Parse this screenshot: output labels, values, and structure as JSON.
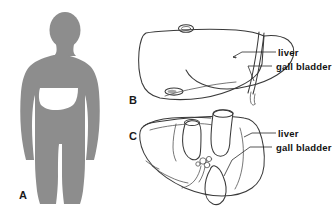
{
  "figure": {
    "background_color": "#ffffff",
    "ink_color": "#3a3a3a",
    "silhouette_color": "#8d8d8d",
    "organ_shade_color": "#9a9a9a"
  },
  "panels": [
    {
      "id": "A",
      "letter": "A",
      "caption": "",
      "description": "body-silhouette-with-liver-position"
    },
    {
      "id": "B",
      "letter": "B",
      "caption": "",
      "description": "liver-anterior-view"
    },
    {
      "id": "C",
      "letter": "C",
      "caption": "",
      "description": "liver-inferior-view"
    }
  ],
  "labels": {
    "panel_b": [
      {
        "key": "liver",
        "text": "liver"
      },
      {
        "key": "gall_bladder",
        "text": "gall bladder"
      }
    ],
    "panel_c": [
      {
        "key": "liver",
        "text": "liver"
      },
      {
        "key": "gall_bladder",
        "text": "gall bladder"
      }
    ]
  }
}
